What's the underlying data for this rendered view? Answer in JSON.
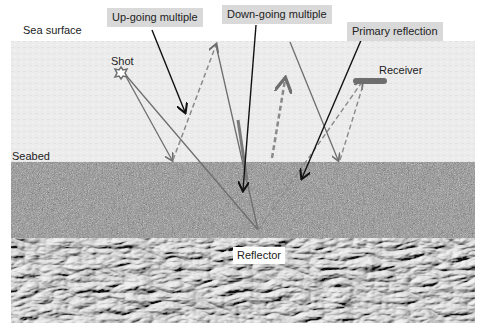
{
  "diagram": {
    "type": "marine-seismic-multiples",
    "layers": [
      {
        "name": "water",
        "color": "#ececec"
      },
      {
        "name": "sediment",
        "color": "#8a8a8a"
      },
      {
        "name": "rock",
        "color": "#9a9a9a"
      }
    ],
    "labels": {
      "sea_surface": "Sea surface",
      "up_going_multiple": "Up-going multiple",
      "down_going_multiple": "Down-going multiple",
      "primary_reflection": "Primary reflection",
      "shot": "Shot",
      "receiver": "Receiver",
      "seabed": "Seabed",
      "reflector": "Reflector"
    },
    "colors": {
      "ray": "#6e6e6e",
      "pointer": "#111111",
      "label_box": "#d9d9d9"
    }
  }
}
